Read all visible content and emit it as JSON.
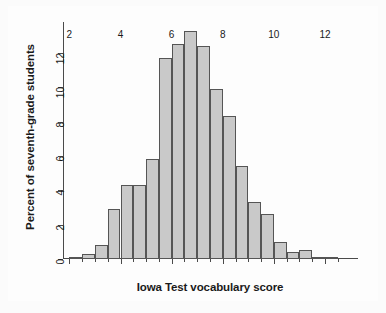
{
  "chart_data": {
    "type": "bar",
    "title": "",
    "subtitle": "",
    "xlabel": "Iowa Test vocabulary score",
    "ylabel": "Percent of seventh-grade students",
    "xlim": [
      1.75,
      12.9
    ],
    "ylim": [
      0,
      13.8
    ],
    "grid": false,
    "legend": null,
    "bin_width": 0.5,
    "xticks": [
      2,
      4,
      6,
      8,
      10,
      12
    ],
    "xtick_labels": [
      "2",
      "4",
      "6",
      "8",
      "10",
      "12"
    ],
    "yticks": [
      0,
      2,
      4,
      6,
      8,
      10,
      12
    ],
    "ytick_labels": [
      "0",
      "2",
      "4",
      "6",
      "8",
      "10",
      "12"
    ],
    "bin_edges": [
      2.0,
      2.5,
      3.0,
      3.5,
      4.0,
      4.5,
      5.0,
      5.5,
      6.0,
      6.5,
      7.0,
      7.5,
      8.0,
      8.5,
      9.0,
      9.5,
      10.0,
      10.5,
      11.0,
      11.5,
      12.0,
      12.5
    ],
    "categories": [
      "2.0-2.5",
      "2.5-3.0",
      "3.0-3.5",
      "3.5-4.0",
      "4.0-4.5",
      "4.5-5.0",
      "5.0-5.5",
      "5.5-6.0",
      "6.0-6.5",
      "6.5-7.0",
      "7.0-7.5",
      "7.5-8.0",
      "8.0-8.5",
      "8.5-9.0",
      "9.0-9.5",
      "9.5-10.0",
      "10.0-10.5",
      "10.5-11.0",
      "11.0-11.5",
      "11.5-12.0",
      "12.0-12.5"
    ],
    "values": [
      0.1,
      0.3,
      0.8,
      2.9,
      4.3,
      4.3,
      5.8,
      11.7,
      12.5,
      13.3,
      12.4,
      9.9,
      8.3,
      5.4,
      3.3,
      2.6,
      1.0,
      0.4,
      0.5,
      0.0,
      0.1
    ],
    "bar_color": "#c9c9c9",
    "bar_edge_color": "#555555",
    "axis_color": "#4a4a4a",
    "background_color": "#fdfdfd"
  }
}
